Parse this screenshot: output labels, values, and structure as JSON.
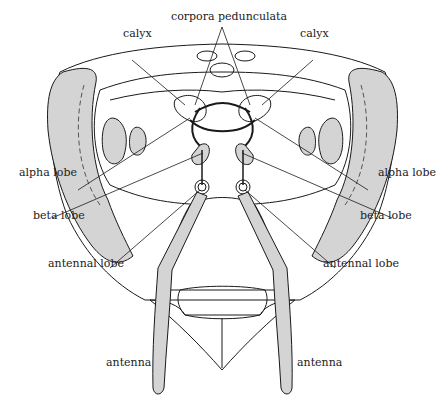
{
  "diagram": {
    "colors": {
      "line": "#1a1a1a",
      "fill_gray": "#d4d4d4",
      "background": "#ffffff"
    }
  },
  "labels": {
    "corpora_pedunculata": "corpora pedunculata",
    "calyx_left": "calyx",
    "calyx_right": "calyx",
    "alpha_lobe_left": "alpha lobe",
    "alpha_lobe_right": "alpha lobe",
    "beta_lobe_left": "beta lobe",
    "beta_lobe_right": "beta lobe",
    "antennal_lobe_left": "antennal lobe",
    "antennal_lobe_right": "antennal lobe",
    "antenna_left": "antenna",
    "antenna_right": "antenna"
  }
}
